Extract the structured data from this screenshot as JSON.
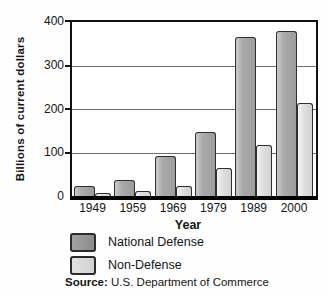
{
  "chart_data": {
    "type": "bar",
    "categories": [
      "1949",
      "1959",
      "1969",
      "1979",
      "1989",
      "2000"
    ],
    "series": [
      {
        "name": "National Defense",
        "color": "#9c9c9c",
        "values": [
          23,
          37,
          92,
          146,
          365,
          380
        ]
      },
      {
        "name": "Non-Defense",
        "color": "#d9d9d9",
        "values": [
          8,
          11,
          23,
          64,
          118,
          213
        ]
      }
    ],
    "title": "",
    "xlabel": "Year",
    "ylabel": "Billions of current dollars",
    "ylim": [
      0,
      400
    ],
    "y_ticks": [
      "400",
      "300",
      "200",
      "100",
      "0"
    ],
    "grid": true,
    "legend_position": "bottom-left"
  },
  "source": {
    "label": "Source:",
    "text": " U.S. Department of Commerce"
  }
}
